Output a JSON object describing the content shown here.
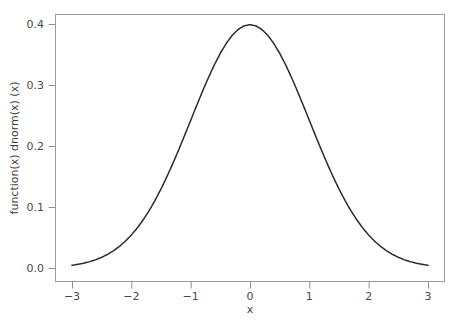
{
  "chart_data": {
    "type": "line",
    "title": "",
    "xlabel": "x",
    "ylabel": "function(x) dnorm(x) (x)",
    "xlim": [
      -3,
      3
    ],
    "ylim": [
      0.0,
      0.4
    ],
    "grid": false,
    "legend": null,
    "legend_position": "none",
    "series": [
      {
        "name": "dnorm(x)",
        "color": "#2b2b2b",
        "x": [
          -3.0,
          -2.9,
          -2.8,
          -2.7,
          -2.6,
          -2.5,
          -2.4,
          -2.3,
          -2.2,
          -2.1,
          -2.0,
          -1.9,
          -1.8,
          -1.7,
          -1.6,
          -1.5,
          -1.4,
          -1.3,
          -1.2,
          -1.1,
          -1.0,
          -0.9,
          -0.8,
          -0.7,
          -0.6,
          -0.5,
          -0.4,
          -0.3,
          -0.2,
          -0.1,
          0.0,
          0.1,
          0.2,
          0.3,
          0.4,
          0.5,
          0.6,
          0.7,
          0.8,
          0.9,
          1.0,
          1.1,
          1.2,
          1.3,
          1.4,
          1.5,
          1.6,
          1.7,
          1.8,
          1.9,
          2.0,
          2.1,
          2.2,
          2.3,
          2.4,
          2.5,
          2.6,
          2.7,
          2.8,
          2.9,
          3.0
        ],
        "values": [
          0.0044,
          0.006,
          0.0079,
          0.0104,
          0.0136,
          0.0175,
          0.0224,
          0.0283,
          0.0355,
          0.044,
          0.054,
          0.0656,
          0.079,
          0.094,
          0.1109,
          0.1295,
          0.1497,
          0.1714,
          0.1942,
          0.2179,
          0.242,
          0.2661,
          0.2897,
          0.3123,
          0.3332,
          0.3521,
          0.3683,
          0.3814,
          0.391,
          0.397,
          0.3989,
          0.397,
          0.391,
          0.3814,
          0.3683,
          0.3521,
          0.3332,
          0.3123,
          0.2897,
          0.2661,
          0.242,
          0.2179,
          0.1942,
          0.1714,
          0.1497,
          0.1295,
          0.1109,
          0.094,
          0.079,
          0.0656,
          0.054,
          0.044,
          0.0355,
          0.0283,
          0.0224,
          0.0175,
          0.0136,
          0.0104,
          0.0079,
          0.006,
          0.0044
        ]
      }
    ],
    "x_ticks": [
      {
        "value": -3,
        "label": "−3"
      },
      {
        "value": -2,
        "label": "−2"
      },
      {
        "value": -1,
        "label": "−1"
      },
      {
        "value": 0,
        "label": "0"
      },
      {
        "value": 1,
        "label": "1"
      },
      {
        "value": 2,
        "label": "2"
      },
      {
        "value": 3,
        "label": "3"
      }
    ],
    "y_ticks": [
      {
        "value": 0.0,
        "label": "0.0"
      },
      {
        "value": 0.1,
        "label": "0.1"
      },
      {
        "value": 0.2,
        "label": "0.2"
      },
      {
        "value": 0.3,
        "label": "0.3"
      },
      {
        "value": 0.4,
        "label": "0.4"
      }
    ],
    "colors": {
      "curve": "#2b2b2b",
      "frame": "#9a9a9a",
      "text": "#3f3f3f",
      "background": "#ffffff"
    }
  }
}
